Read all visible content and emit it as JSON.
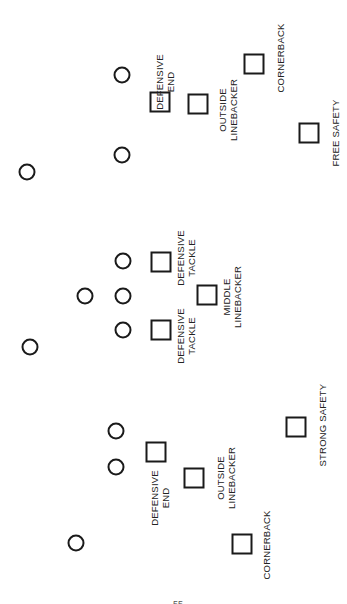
{
  "diagram": {
    "title": "",
    "orientation": "rotated-90",
    "line_color": "#1a1a1a",
    "offense_marker": "circle",
    "defense_marker": "square",
    "page_number_fragment": "55"
  },
  "offense": [
    {
      "id": "o1",
      "x": 122,
      "y": 75
    },
    {
      "id": "o2",
      "x": 122,
      "y": 155
    },
    {
      "id": "o3",
      "x": 27,
      "y": 172
    },
    {
      "id": "o4",
      "x": 123,
      "y": 261
    },
    {
      "id": "o5",
      "x": 85,
      "y": 296
    },
    {
      "id": "o6",
      "x": 123,
      "y": 296
    },
    {
      "id": "o7",
      "x": 123,
      "y": 330
    },
    {
      "id": "o8",
      "x": 30,
      "y": 347
    },
    {
      "id": "o9",
      "x": 116,
      "y": 431
    },
    {
      "id": "o10",
      "x": 116,
      "y": 467
    },
    {
      "id": "o11",
      "x": 76,
      "y": 543
    }
  ],
  "defense": [
    {
      "id": "de_top",
      "position": "Defensive End",
      "x": 160,
      "y": 102,
      "label_lines": [
        "DEFENSIVE",
        "END"
      ],
      "label_x": 165,
      "label_y": 82
    },
    {
      "id": "olb_top",
      "position": "Outside Linebacker",
      "x": 198,
      "y": 104,
      "label_lines": [
        "OUTSIDE",
        "LINEBACKER"
      ],
      "label_x": 228,
      "label_y": 110
    },
    {
      "id": "cb_top",
      "position": "Cornerback",
      "x": 254,
      "y": 64,
      "label_lines": [
        "CORNERBACK"
      ],
      "label_x": 280,
      "label_y": 58
    },
    {
      "id": "fs",
      "position": "Free Safety",
      "x": 309,
      "y": 133,
      "label_lines": [
        "FREE SAFETY"
      ],
      "label_x": 335,
      "label_y": 133
    },
    {
      "id": "dt_top",
      "position": "Defensive Tackle",
      "x": 161,
      "y": 262,
      "label_lines": [
        "DEFENSIVE",
        "TACKLE"
      ],
      "label_x": 186,
      "label_y": 258
    },
    {
      "id": "mlb",
      "position": "Middle Linebacker",
      "x": 207,
      "y": 295,
      "label_lines": [
        "MIDDLE",
        "LINEBACKER"
      ],
      "label_x": 232,
      "label_y": 297
    },
    {
      "id": "dt_bot",
      "position": "Defensive Tackle",
      "x": 161,
      "y": 330,
      "label_lines": [
        "DEFENSIVE",
        "TACKLE"
      ],
      "label_x": 186,
      "label_y": 336
    },
    {
      "id": "ss",
      "position": "Strong Safety",
      "x": 296,
      "y": 427,
      "label_lines": [
        "STRONG SAFETY"
      ],
      "label_x": 322,
      "label_y": 425
    },
    {
      "id": "de_bot",
      "position": "Defensive End",
      "x": 156,
      "y": 452,
      "label_lines": [
        "DEFENSIVE",
        "END"
      ],
      "label_x": 160,
      "label_y": 498
    },
    {
      "id": "olb_bot",
      "position": "Outside Linebacker",
      "x": 194,
      "y": 478,
      "label_lines": [
        "OUTSIDE",
        "LINEBACKER"
      ],
      "label_x": 226,
      "label_y": 478
    },
    {
      "id": "cb_bot",
      "position": "Cornerback",
      "x": 242,
      "y": 544,
      "label_lines": [
        "CORNERBACK"
      ],
      "label_x": 266,
      "label_y": 545
    }
  ]
}
